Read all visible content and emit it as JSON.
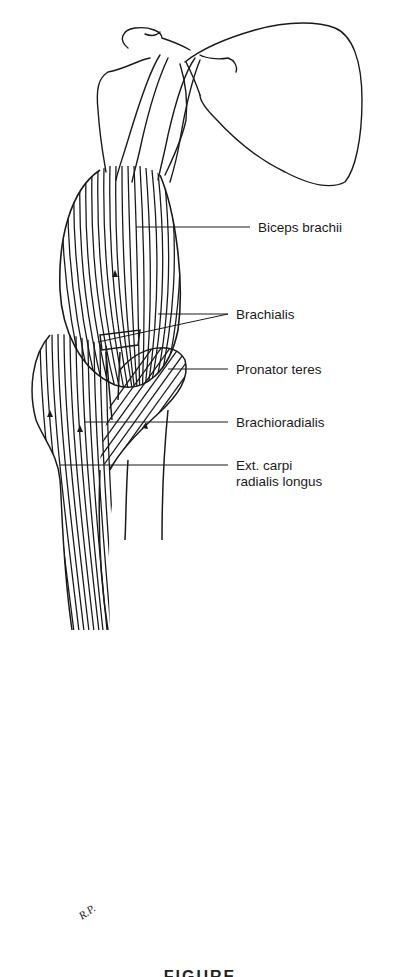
{
  "figure": {
    "caption": "FIGURE",
    "artist_initials": "R.P."
  },
  "labels": [
    {
      "text": "Biceps brachii",
      "line": [
        "Biceps brachii"
      ]
    },
    {
      "text": "Brachialis",
      "line": [
        "Brachialis"
      ]
    },
    {
      "text": "Pronator teres",
      "line": [
        "Pronator teres"
      ]
    },
    {
      "text": "Brachioradialis",
      "line": [
        "Brachioradialis"
      ]
    },
    {
      "text": "Ext. carpi radialis longus",
      "line": [
        "Ext. carpi",
        "radialis longus"
      ]
    }
  ],
  "colors": {
    "ink": "#1a1a1a",
    "background": "#ffffff"
  }
}
